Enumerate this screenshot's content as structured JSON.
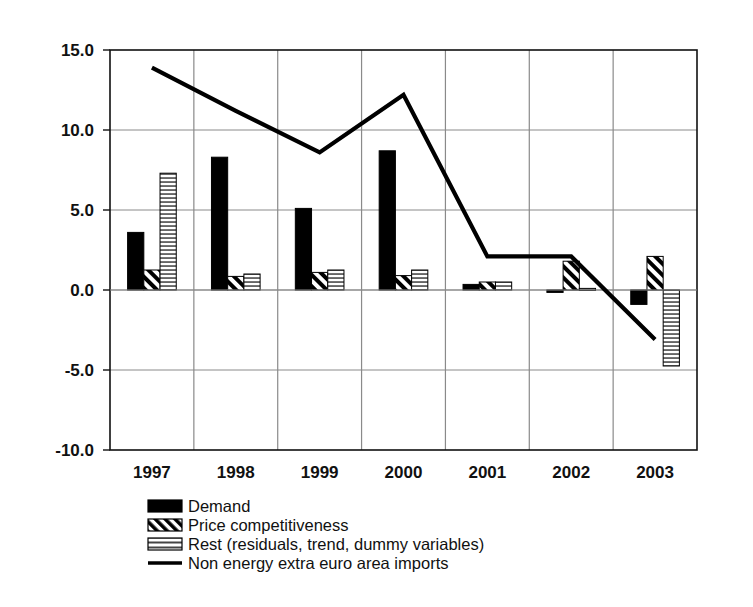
{
  "chart_data": {
    "type": "bar",
    "title": "",
    "subtitle": "",
    "xlabel": "",
    "ylabel": "",
    "categories": [
      "1997",
      "1998",
      "1999",
      "2000",
      "2001",
      "2002",
      "2003"
    ],
    "ylim": [
      -10.0,
      15.0
    ],
    "ytick_labels": [
      "15.0",
      "10.0",
      "5.0",
      "0.0",
      "-5.0",
      "-10.0"
    ],
    "ytick_values": [
      15.0,
      10.0,
      5.0,
      0.0,
      -5.0,
      -10.0
    ],
    "grid": true,
    "legend_position": "bottom-left",
    "series": [
      {
        "name": "Demand",
        "kind": "bar",
        "fill": "solid-black",
        "values": [
          3.6,
          8.3,
          5.1,
          8.7,
          0.35,
          -0.15,
          -0.9
        ]
      },
      {
        "name": "Price competitiveness",
        "kind": "bar",
        "fill": "diagonal-hatch",
        "values": [
          1.25,
          0.85,
          1.1,
          0.9,
          0.5,
          1.8,
          2.1
        ]
      },
      {
        "name": "Rest (residuals, trend, dummy variables)",
        "kind": "bar",
        "fill": "horizontal-lines",
        "values": [
          7.3,
          1.0,
          1.25,
          1.25,
          0.5,
          0.1,
          -4.75
        ]
      },
      {
        "name": "Non energy extra euro area imports",
        "kind": "line",
        "fill": "solid-line",
        "values": [
          13.9,
          11.2,
          8.6,
          12.2,
          2.1,
          2.1,
          -3.1
        ]
      }
    ],
    "colors": {
      "demand": "#000000",
      "price_competitiveness": "#000000",
      "rest": "#cccccc",
      "line": "#000000",
      "axis": "#111111",
      "grid": "#8a8a8a",
      "background": "#ffffff"
    }
  },
  "legend": {
    "items": [
      {
        "label": "Demand",
        "swatch": "solid-black-swatch"
      },
      {
        "label": "Price competitiveness",
        "swatch": "diagonal-hatch-swatch"
      },
      {
        "label": "Rest (residuals, trend, dummy variables)",
        "swatch": "horizontal-lines-swatch"
      },
      {
        "label": "Non energy extra euro area imports",
        "swatch": "line-swatch"
      }
    ]
  }
}
